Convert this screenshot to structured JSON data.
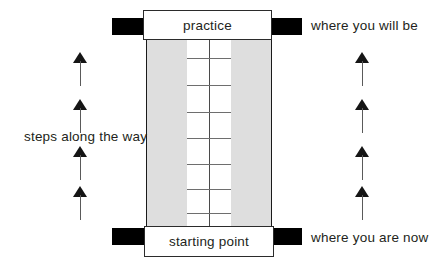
{
  "diagram": {
    "title_top": "practice",
    "title_bottom": "starting point",
    "annotations": {
      "top_right": "where you will be",
      "bottom_right": "where you are now",
      "left_middle": "steps along the way"
    },
    "colors": {
      "rail_fill": "#dedede",
      "bar_fill": "#000000",
      "outline": "#1a1a1a",
      "rung": "#6e6e6e",
      "text": "#231f20",
      "background": "#ffffff"
    },
    "ladder": {
      "rung_count": 8,
      "rung_offsets_px": [
        21,
        48,
        75,
        101,
        127,
        152,
        176,
        192
      ],
      "has_center_stile": true
    },
    "arrows": {
      "direction": "up",
      "count_left": 4,
      "count_right": 4,
      "left_x": 73,
      "right_x": 355,
      "y_positions": [
        52,
        99,
        146,
        186
      ]
    }
  }
}
